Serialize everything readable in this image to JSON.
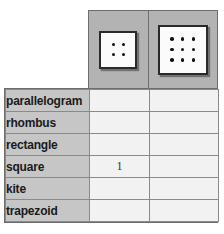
{
  "table": {
    "column_headers": [
      {
        "icon": "dot-grid-2x2-icon",
        "rows": 2,
        "cols": 2,
        "dot_count": 4
      },
      {
        "icon": "dot-grid-3x3-icon",
        "rows": 3,
        "cols": 3,
        "dot_count": 9
      }
    ],
    "rows": [
      {
        "label": "parallelogram",
        "values": [
          "",
          ""
        ]
      },
      {
        "label": "rhombus",
        "values": [
          "",
          ""
        ]
      },
      {
        "label": "rectangle",
        "values": [
          "",
          ""
        ]
      },
      {
        "label": "square",
        "values": [
          "1",
          ""
        ]
      },
      {
        "label": "kite",
        "values": [
          "",
          ""
        ]
      },
      {
        "label": "trapezoid",
        "values": [
          "",
          ""
        ]
      }
    ]
  },
  "colors": {
    "header_background": "#b3b3b3",
    "label_background": "#c6c6c6",
    "data_background": "#f2f2f2",
    "border": "#6d6d6d",
    "grid_line": "#8a8a8a",
    "dot": "#111111",
    "text": "#1a1a1a"
  }
}
